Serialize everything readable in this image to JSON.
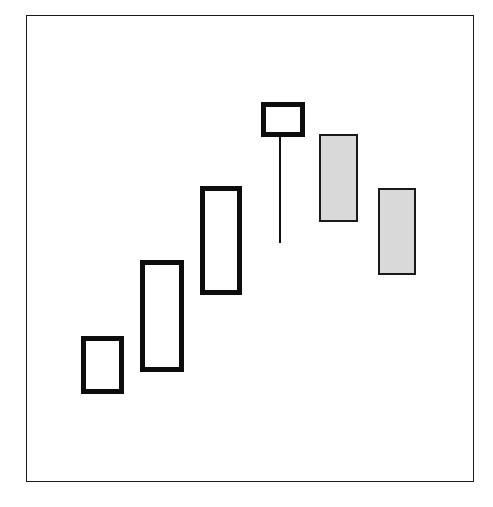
{
  "figure": {
    "width": 493,
    "height": 507,
    "background_color": "#ffffff",
    "frame": {
      "x": 26,
      "y": 15,
      "width": 448,
      "height": 467,
      "border_color": "#1a1a1a",
      "border_width": 1.6
    }
  },
  "chart_data": {
    "type": "candlestick",
    "title": "",
    "subtitle": "",
    "xlabel": "",
    "ylabel": "",
    "grid": false,
    "legend": null,
    "axis_visible": false,
    "tick_labels": [],
    "annotations": [],
    "colors": {
      "bullish_fill": "#ffffff",
      "bullish_border": "#0d0d0d",
      "bearish_fill": "#d9d9d9",
      "bearish_border": "#1a1a1a",
      "wick": "#101010",
      "frame": "#1a1a1a",
      "background": "#ffffff"
    },
    "categories": [
      "1",
      "2",
      "3",
      "4",
      "5",
      "6"
    ],
    "candles": [
      {
        "index": 1,
        "direction": "bullish",
        "label": "candle-1",
        "body_px": {
          "x": 81,
          "y": 336,
          "width": 43,
          "height": 58
        },
        "border_px": 5,
        "wick": null,
        "open": 19,
        "close": 31,
        "high": 31,
        "low": 19
      },
      {
        "index": 2,
        "direction": "bullish",
        "label": "candle-2",
        "body_px": {
          "x": 140,
          "y": 260,
          "width": 44,
          "height": 112
        },
        "border_px": 5,
        "wick": null,
        "open": 24,
        "close": 48,
        "high": 48,
        "low": 24
      },
      {
        "index": 3,
        "direction": "bullish",
        "label": "candle-3",
        "body_px": {
          "x": 200,
          "y": 186,
          "width": 42,
          "height": 109
        },
        "border_px": 5,
        "wick": null,
        "open": 40,
        "close": 63,
        "high": 63,
        "low": 40
      },
      {
        "index": 4,
        "direction": "bullish",
        "label": "candle-4",
        "body_px": {
          "x": 261,
          "y": 102,
          "width": 44,
          "height": 35
        },
        "border_px": 5,
        "wick": {
          "x": 279,
          "y_top": 137,
          "y_bottom": 243,
          "width": 2
        },
        "open": 71,
        "close": 78,
        "high": 78,
        "low": 48
      },
      {
        "index": 5,
        "direction": "bearish",
        "label": "candle-5",
        "body_px": {
          "x": 319,
          "y": 134,
          "width": 39,
          "height": 88
        },
        "border_px": 2,
        "wick": null,
        "open": 71,
        "close": 53,
        "high": 71,
        "low": 53
      },
      {
        "index": 6,
        "direction": "bearish",
        "label": "candle-6",
        "body_px": {
          "x": 378,
          "y": 188,
          "width": 38,
          "height": 87
        },
        "border_px": 2,
        "wick": null,
        "open": 59,
        "close": 40,
        "high": 59,
        "low": 40
      }
    ]
  }
}
